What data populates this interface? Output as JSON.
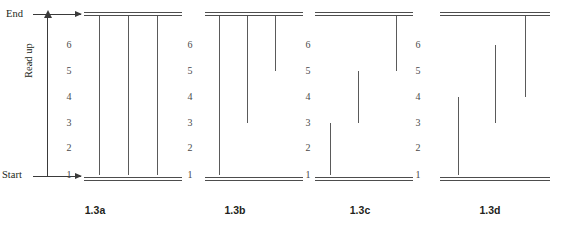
{
  "figure": {
    "axis": {
      "end_label": "End",
      "start_label": "Start",
      "direction_label": "Read up",
      "tick_labels": [
        "6",
        "5",
        "4",
        "3",
        "2",
        "1"
      ]
    },
    "colors": {
      "ink": "#231f20",
      "rule": "#4d4d4d",
      "stroke": "#5a5a5a",
      "tick": "#4a4a4a",
      "background": "#ffffff"
    },
    "panels": [
      {
        "caption": "1.3a",
        "strokes": [
          {
            "from": 1,
            "to": "end"
          },
          {
            "from": 1,
            "to": "end"
          },
          {
            "from": 1,
            "to": "end"
          }
        ]
      },
      {
        "caption": "1.3b",
        "strokes": [
          {
            "from": 1,
            "to": "end"
          },
          {
            "from": 3,
            "to": "end"
          },
          {
            "from": 5,
            "to": "end"
          }
        ]
      },
      {
        "caption": "1.3c",
        "strokes": [
          {
            "from": 1,
            "to": 3
          },
          {
            "from": 3,
            "to": 5
          },
          {
            "from": 5,
            "to": "end"
          }
        ]
      },
      {
        "caption": "1.3d",
        "strokes": [
          {
            "from": 1,
            "to": 4
          },
          {
            "from": 3,
            "to": 6
          },
          {
            "from": 4,
            "to": "end"
          }
        ]
      }
    ]
  },
  "chart_data": {
    "type": "diagram",
    "title": "",
    "levels": [
      1,
      2,
      3,
      4,
      5,
      6
    ],
    "level_y": {
      "1": 175,
      "2": 148,
      "3": 123,
      "4": 97,
      "5": 71,
      "6": 45,
      "end": 15,
      "start": 179
    },
    "panels": [
      {
        "name": "1.3a",
        "strokes": [
          [
            1,
            "end"
          ],
          [
            1,
            "end"
          ],
          [
            1,
            "end"
          ]
        ]
      },
      {
        "name": "1.3b",
        "strokes": [
          [
            1,
            "end"
          ],
          [
            3,
            "end"
          ],
          [
            5,
            "end"
          ]
        ]
      },
      {
        "name": "1.3c",
        "strokes": [
          [
            1,
            3
          ],
          [
            3,
            5
          ],
          [
            5,
            "end"
          ]
        ]
      },
      {
        "name": "1.3d",
        "strokes": [
          [
            1,
            4
          ],
          [
            3,
            6
          ],
          [
            4,
            "end"
          ]
        ]
      }
    ]
  }
}
